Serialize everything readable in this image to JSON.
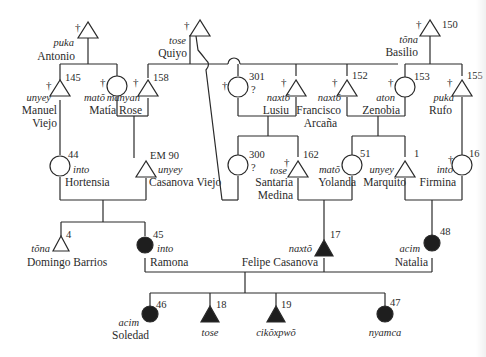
{
  "diagram": {
    "type": "kinship-genealogy",
    "colors": {
      "ink": "#2a2a2a",
      "filled": "#1e1e1e",
      "background": "#ffffff"
    },
    "people": [
      {
        "id": "antonio",
        "name": "Antonio",
        "term": "puka",
        "number": "",
        "sex": "male",
        "deceased": true,
        "filled": false
      },
      {
        "id": "quiyo",
        "name": "Quiyo",
        "term": "tose",
        "number": "",
        "sex": "male",
        "deceased": true,
        "filled": false
      },
      {
        "id": "basilio",
        "name": "Basilio",
        "term": "tõna",
        "number": "150",
        "sex": "male",
        "deceased": true,
        "filled": false
      },
      {
        "id": "manuel",
        "name": "Manuel",
        "name2": "Viejo",
        "term": "unyey",
        "number": "145",
        "sex": "male",
        "deceased": true,
        "filled": false
      },
      {
        "id": "mato_wife",
        "name": "",
        "term": "matõ",
        "number": "",
        "sex": "female",
        "deceased": true,
        "filled": false
      },
      {
        "id": "matia",
        "name": "Matía Rose",
        "term": "manyan",
        "number": "158",
        "sex": "male",
        "deceased": true,
        "filled": false
      },
      {
        "id": "p301",
        "name": "",
        "term": "",
        "number": "301",
        "question": "?",
        "sex": "female",
        "deceased": true,
        "filled": false
      },
      {
        "id": "lusiu",
        "name": "Lusiu",
        "term": "naxtõ",
        "number": "",
        "sex": "male",
        "deceased": true,
        "filled": false
      },
      {
        "id": "francisco",
        "name": "Francisco",
        "name2": "Arcaña",
        "term": "naxtõ",
        "number": "152",
        "sex": "male",
        "deceased": true,
        "filled": false
      },
      {
        "id": "zenobia",
        "name": "Zenobia",
        "term": "aton",
        "number": "153",
        "sex": "female",
        "deceased": true,
        "filled": false
      },
      {
        "id": "rufo",
        "name": "Rufo",
        "term": "puka",
        "number": "155",
        "sex": "male",
        "deceased": true,
        "filled": false
      },
      {
        "id": "hortensia",
        "name": "Hortensia",
        "term": "into",
        "number": "44",
        "sex": "female",
        "deceased": false,
        "filled": false
      },
      {
        "id": "casanova_viejo",
        "name": "Casanova Viejo",
        "term": "unyey",
        "number": "EM 90",
        "sex": "male",
        "deceased": false,
        "filled": false
      },
      {
        "id": "p300",
        "name": "",
        "term": "",
        "number": "300",
        "question": "?",
        "sex": "female",
        "deceased": false,
        "filled": false
      },
      {
        "id": "santaria",
        "name": "Santaria",
        "name2": "Medina",
        "term": "tose",
        "number": "162",
        "sex": "male",
        "deceased": true,
        "filled": false
      },
      {
        "id": "yolanda",
        "name": "Yolanda",
        "term": "matõ",
        "number": "51",
        "sex": "female",
        "deceased": false,
        "filled": false
      },
      {
        "id": "marquito",
        "name": "Marquito",
        "term": "unyey",
        "number": "1",
        "sex": "male",
        "deceased": false,
        "filled": false
      },
      {
        "id": "firmina",
        "name": "Firmina",
        "term": "into",
        "number": "16",
        "sex": "female",
        "deceased": true,
        "filled": false
      },
      {
        "id": "domingo",
        "name": "Domingo Barrios",
        "term": "tõna",
        "number": "4",
        "sex": "male",
        "deceased": false,
        "filled": false
      },
      {
        "id": "ramona",
        "name": "Ramona",
        "term": "into",
        "number": "45",
        "sex": "female",
        "deceased": false,
        "filled": true
      },
      {
        "id": "felipe",
        "name": "Felipe Casanova",
        "term": "naxtõ",
        "number": "17",
        "sex": "male",
        "deceased": false,
        "filled": true
      },
      {
        "id": "natalia",
        "name": "Natalia",
        "term": "acim",
        "number": "48",
        "sex": "female",
        "deceased": false,
        "filled": true
      },
      {
        "id": "soledad",
        "name": "Soledad",
        "term": "acim",
        "number": "46",
        "sex": "female",
        "deceased": false,
        "filled": true
      },
      {
        "id": "c18",
        "name": "",
        "term": "tose",
        "number": "18",
        "sex": "male",
        "deceased": false,
        "filled": true
      },
      {
        "id": "c19",
        "name": "",
        "term": "cikõxpwõ",
        "number": "19",
        "sex": "male",
        "deceased": false,
        "filled": true
      },
      {
        "id": "c47",
        "name": "",
        "term": "nyamca",
        "number": "47",
        "sex": "female",
        "deceased": false,
        "filled": true
      }
    ],
    "dagger_symbol": "†"
  }
}
